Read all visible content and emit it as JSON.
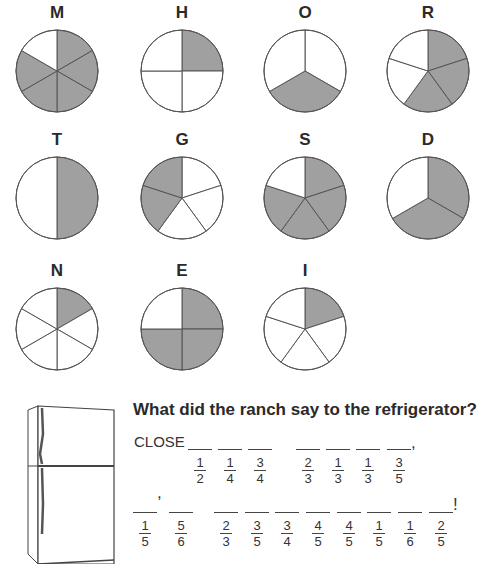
{
  "colors": {
    "shaded": "#a0a0a0",
    "outline": "#555555",
    "unshaded": "#ffffff"
  },
  "pies": [
    {
      "letter": "M",
      "slices": 6,
      "shaded": [
        0,
        1,
        2,
        3,
        4
      ],
      "fraction": "5/6"
    },
    {
      "letter": "H",
      "slices": 4,
      "shaded": [
        0
      ],
      "fraction": "1/4"
    },
    {
      "letter": "O",
      "slices": 3,
      "shaded": [
        1
      ],
      "fraction": "1/3"
    },
    {
      "letter": "R",
      "slices": 5,
      "shaded": [
        0,
        1,
        2
      ],
      "fraction": "3/5"
    },
    {
      "letter": "T",
      "slices": 2,
      "shaded": [
        0
      ],
      "fraction": "1/2"
    },
    {
      "letter": "G",
      "slices": 5,
      "shaded": [
        3,
        4
      ],
      "fraction": "2/5"
    },
    {
      "letter": "S",
      "slices": 5,
      "shaded": [
        0,
        1,
        2,
        3
      ],
      "fraction": "4/5"
    },
    {
      "letter": "D",
      "slices": 3,
      "shaded": [
        0,
        1
      ],
      "fraction": "2/3"
    },
    {
      "letter": "N",
      "slices": 6,
      "shaded": [
        0
      ],
      "fraction": "1/6"
    },
    {
      "letter": "E",
      "slices": 4,
      "shaded": [
        0,
        1,
        2
      ],
      "fraction": "3/4"
    },
    {
      "letter": "I",
      "slices": 5,
      "shaded": [
        0
      ],
      "fraction": "1/5"
    }
  ],
  "puzzle": {
    "question": "What did the ranch say to the refrigerator?",
    "prefix": "CLOSE",
    "line1": [
      {
        "num": "1",
        "den": "2"
      },
      {
        "num": "1",
        "den": "4"
      },
      {
        "num": "3",
        "den": "4"
      },
      {
        "num": "2",
        "den": "3"
      },
      {
        "num": "1",
        "den": "3"
      },
      {
        "num": "1",
        "den": "3"
      },
      {
        "num": "3",
        "den": "5"
      }
    ],
    "line1_end": ",",
    "line2": [
      {
        "num": "1",
        "den": "5"
      },
      {
        "num": "5",
        "den": "6"
      },
      {
        "num": "2",
        "den": "3"
      },
      {
        "num": "3",
        "den": "5"
      },
      {
        "num": "3",
        "den": "4"
      },
      {
        "num": "4",
        "den": "5"
      },
      {
        "num": "4",
        "den": "5"
      },
      {
        "num": "1",
        "den": "5"
      },
      {
        "num": "1",
        "den": "6"
      },
      {
        "num": "2",
        "den": "5"
      }
    ],
    "line2_comma": ",",
    "line2_end": "!"
  }
}
